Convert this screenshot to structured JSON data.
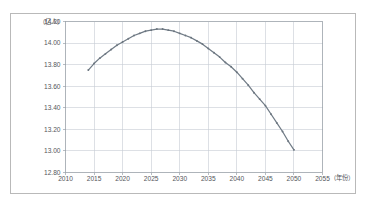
{
  "figure": {
    "background_color": "#ffffff",
    "frame_color": "#b9b9b9",
    "grid_color": "#c6ccd4",
    "series_color": "#707b86",
    "tick_text_color": "#54565a"
  },
  "labels": {
    "y_unit": "（亿人）",
    "x_unit": "（年份）"
  },
  "chart_data": {
    "type": "line",
    "title": "",
    "subtitle": "",
    "xlabel": "（年份）",
    "ylabel": "（亿人）",
    "xlim": [
      2010,
      2055
    ],
    "ylim": [
      12.8,
      14.2
    ],
    "xticks": [
      2010,
      2015,
      2020,
      2025,
      2030,
      2035,
      2040,
      2045,
      2050,
      2055
    ],
    "xtick_labels": [
      "2010",
      "2015",
      "2020",
      "2025",
      "2030",
      "2035",
      "2040",
      "2045",
      "2050",
      "2055"
    ],
    "yticks": [
      12.8,
      13.0,
      13.2,
      13.4,
      13.6,
      13.8,
      14.0,
      14.2
    ],
    "ytick_labels": [
      "12.80",
      "13.00",
      "13.20",
      "13.40",
      "13.60",
      "13.80",
      "14.00",
      "14.20"
    ],
    "grid": true,
    "grid_axes": "both",
    "legend": false,
    "legend_position": "none",
    "markers": true,
    "series": [
      {
        "name": "总人口",
        "color": "#707b86",
        "x": [
          2014,
          2015,
          2016,
          2017,
          2018,
          2019,
          2020,
          2021,
          2022,
          2023,
          2024,
          2025,
          2026,
          2027,
          2028,
          2029,
          2030,
          2031,
          2032,
          2033,
          2034,
          2035,
          2036,
          2037,
          2038,
          2039,
          2040,
          2041,
          2042,
          2043,
          2044,
          2045,
          2046,
          2047,
          2048,
          2049,
          2050
        ],
        "values": [
          13.75,
          13.81,
          13.86,
          13.9,
          13.94,
          13.98,
          14.01,
          14.04,
          14.07,
          14.09,
          14.11,
          14.12,
          14.13,
          14.13,
          14.12,
          14.11,
          14.09,
          14.07,
          14.05,
          14.02,
          13.99,
          13.95,
          13.91,
          13.87,
          13.82,
          13.78,
          13.73,
          13.67,
          13.61,
          13.54,
          13.48,
          13.42,
          13.34,
          13.26,
          13.18,
          13.09,
          13.01
        ]
      }
    ],
    "annotations": []
  }
}
